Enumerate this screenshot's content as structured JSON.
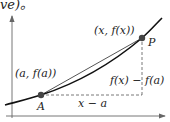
{
  "top_fragment": "ve)。",
  "labels": {
    "point_p_coords": "(x, f(x))",
    "point_p_name": "P",
    "point_a_coords": "(a, f(a))",
    "point_a_name": "A",
    "vertical_difference": "f(x) − f(a)",
    "horizontal_difference": "x − a"
  },
  "colors": {
    "curve": "#111111",
    "secant": "#555555",
    "axes": "#666666",
    "dashed": "#555555",
    "points": "#444444"
  }
}
